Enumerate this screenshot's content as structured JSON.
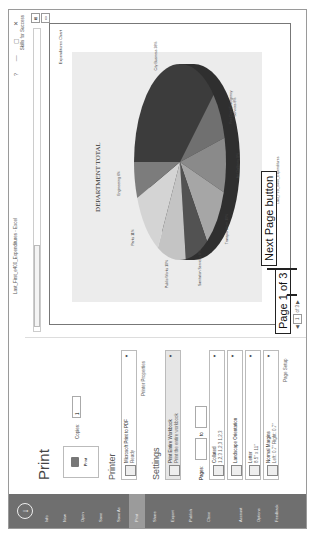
{
  "window": {
    "title": "Last_First_e400_Expenditures - Excel",
    "help": "?",
    "minimize": "—",
    "restore": "▢",
    "close": "✕",
    "account_label": "Skills for Success"
  },
  "sidebar": {
    "back_icon": "back-arrow-circle-icon",
    "items": [
      {
        "label": "Info"
      },
      {
        "label": "New"
      },
      {
        "label": "Open"
      },
      {
        "label": "Save"
      },
      {
        "label": "Save As"
      },
      {
        "label": "Print",
        "selected": true
      },
      {
        "label": "Share"
      },
      {
        "label": "Export"
      },
      {
        "label": "Publish"
      },
      {
        "label": "Close"
      },
      {
        "label": "Account"
      },
      {
        "label": "Options"
      },
      {
        "label": "Feedback"
      }
    ]
  },
  "print_panel": {
    "heading": "Print",
    "print_button": "Print",
    "copies_label": "Copies:",
    "copies_value": "1",
    "printer_heading": "Printer",
    "printer_name": "Microsoft Print to PDF",
    "printer_status": "Ready",
    "printer_properties": "Printer Properties",
    "settings_heading": "Settings",
    "settings": [
      {
        "title": "Print Entire Workbook",
        "subtitle": "Print the entire workbook"
      },
      {
        "title": "Collated",
        "subtitle": "1,2,3   1,2,3   1,2,3"
      },
      {
        "title": "Landscape Orientation",
        "subtitle": ""
      },
      {
        "title": "Letter",
        "subtitle": "8.5\" x 11\""
      },
      {
        "title": "Normal Margins",
        "subtitle": "Left: 0.7\"   Right: 0.7\""
      }
    ],
    "pages_label": "Pages:",
    "pages_to": "to",
    "page_setup": "Page Setup"
  },
  "preview": {
    "header_right": "Expenditures Chart",
    "footer_left": "Last_First_e400_Expenditures",
    "nav": {
      "prev": "◀",
      "current": "1",
      "of": "of 3",
      "next": "▶"
    }
  },
  "annotations": {
    "page_callout": "Page 1 of 3",
    "next_callout": "Next Page button"
  },
  "chart_data": {
    "type": "pie",
    "title": "DEPARTMENT TOTAL",
    "categories": [
      "City Business",
      "Fire Dept/Emergency Services",
      "Art Galleries",
      "Transportation",
      "Sanitation Services",
      "Public Works",
      "Parks",
      "Engineering"
    ],
    "values": [
      38,
      8,
      9,
      10,
      8,
      10,
      11,
      6
    ],
    "colors": [
      "#3c3c3c",
      "#707070",
      "#8a8a8a",
      "#a6a6a6",
      "#525252",
      "#c4c4c4",
      "#d4d4d4",
      "#7c7c7c"
    ],
    "legend": "data labels",
    "style": "3D"
  }
}
